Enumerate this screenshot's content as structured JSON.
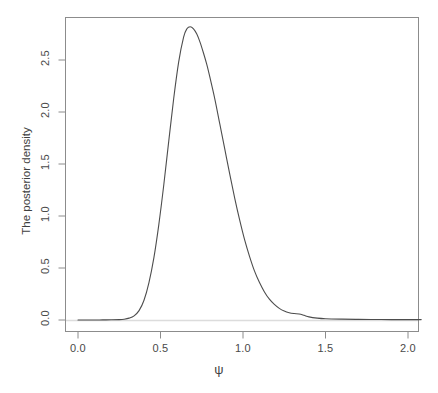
{
  "chart_data": {
    "type": "line",
    "title": "",
    "subtitle": "",
    "xlabel": "ψ",
    "ylabel": "The posterior density",
    "xlim": [
      0.0,
      2.08
    ],
    "ylim": [
      0.0,
      2.92
    ],
    "xticks": [
      0.0,
      0.5,
      1.0,
      1.5,
      2.0
    ],
    "xtick_labels": [
      "0.0",
      "0.5",
      "1.0",
      "1.5",
      "2.0"
    ],
    "yticks": [
      0.0,
      0.5,
      1.0,
      1.5,
      2.0,
      2.5
    ],
    "ytick_labels": [
      "0.0",
      "0.5",
      "1.0",
      "1.5",
      "2.0",
      "2.5"
    ],
    "grid": false,
    "legend": false,
    "line_color": "#4d4d4d",
    "box_color": "#8c8c8c",
    "baseline_color": "#dcdcdc",
    "series": [
      {
        "name": "posterior density",
        "x": [
          0.0,
          0.05,
          0.1,
          0.15,
          0.2,
          0.25,
          0.28,
          0.31,
          0.34,
          0.37,
          0.4,
          0.43,
          0.46,
          0.49,
          0.52,
          0.55,
          0.58,
          0.61,
          0.64,
          0.66,
          0.68,
          0.7,
          0.72,
          0.74,
          0.76,
          0.78,
          0.8,
          0.83,
          0.86,
          0.89,
          0.92,
          0.95,
          0.98,
          1.01,
          1.04,
          1.07,
          1.1,
          1.13,
          1.16,
          1.19,
          1.22,
          1.25,
          1.28,
          1.31,
          1.34,
          1.37,
          1.4,
          1.45,
          1.5,
          1.6,
          1.7,
          1.8,
          1.9,
          2.0,
          2.08
        ],
        "y": [
          0.0,
          0.0,
          0.0,
          0.001,
          0.002,
          0.004,
          0.008,
          0.018,
          0.04,
          0.09,
          0.19,
          0.36,
          0.6,
          0.92,
          1.3,
          1.72,
          2.13,
          2.48,
          2.72,
          2.8,
          2.82,
          2.8,
          2.75,
          2.67,
          2.57,
          2.46,
          2.33,
          2.12,
          1.88,
          1.64,
          1.4,
          1.17,
          0.96,
          0.77,
          0.61,
          0.47,
          0.36,
          0.27,
          0.2,
          0.15,
          0.112,
          0.086,
          0.07,
          0.062,
          0.058,
          0.045,
          0.03,
          0.018,
          0.012,
          0.008,
          0.006,
          0.005,
          0.004,
          0.004,
          0.004
        ]
      }
    ],
    "peak": {
      "x": 0.68,
      "y": 2.82
    }
  },
  "axes": {
    "x_label": "ψ",
    "y_label": "The posterior density",
    "x_tick_labels": [
      "0.0",
      "0.5",
      "1.0",
      "1.5",
      "2.0"
    ],
    "y_tick_labels": [
      "0.0",
      "0.5",
      "1.0",
      "1.5",
      "2.0",
      "2.5"
    ]
  }
}
